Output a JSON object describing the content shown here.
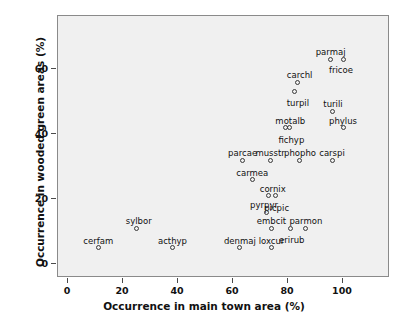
{
  "chart_data": {
    "type": "scatter",
    "title": "",
    "xlabel": "Occurrence in main town area (%)",
    "ylabel": "Occurrence in wooded green areas (%)",
    "xlim": [
      -4,
      118
    ],
    "ylim": [
      -4,
      76
    ],
    "xticks": [
      0,
      20,
      40,
      60,
      80,
      100
    ],
    "yticks": [
      0,
      20,
      40,
      60
    ],
    "xticklabels": [
      "0",
      "20",
      "40",
      "60",
      "80",
      "100"
    ],
    "yticklabels": [
      "0",
      "20",
      "40",
      "60"
    ],
    "grid": false,
    "legend": false,
    "marker": "open-circle",
    "plot_background": "#f0f0f0",
    "marker_color": "#3a3a3a",
    "points": [
      {
        "label": "parmaj",
        "x": 95.5,
        "y": 63.0,
        "label_dx": 0,
        "label_dy": -11
      },
      {
        "label": "fricoe",
        "x": 100.0,
        "y": 63.0,
        "label_dx": -2,
        "label_dy": 7
      },
      {
        "label": "carchl",
        "x": 83.5,
        "y": 56.0,
        "label_dx": 2,
        "label_dy": -11
      },
      {
        "label": "turpil",
        "x": 82.5,
        "y": 53.0,
        "label_dx": 3,
        "label_dy": 7
      },
      {
        "label": "turili",
        "x": 96.0,
        "y": 47.0,
        "label_dx": 1,
        "label_dy": -11
      },
      {
        "label": "phylus",
        "x": 100.0,
        "y": 42.0,
        "label_dx": 0,
        "label_dy": -11
      },
      {
        "label": "motalb",
        "x": 79.0,
        "y": 42.0,
        "label_dx": 5,
        "label_dy": -11
      },
      {
        "label": "fichyp",
        "x": 80.5,
        "y": 42.0,
        "label_dx": 2,
        "label_dy": 8
      },
      {
        "label": "parcae",
        "x": 63.5,
        "y": 32.0,
        "label_dx": 0,
        "label_dy": -11
      },
      {
        "label": "musstr",
        "x": 73.5,
        "y": 32.0,
        "label_dx": 0,
        "label_dy": -11
      },
      {
        "label": "phopho",
        "x": 84.0,
        "y": 32.0,
        "label_dx": 1,
        "label_dy": -11
      },
      {
        "label": "carspi",
        "x": 96.0,
        "y": 32.0,
        "label_dx": 0,
        "label_dy": -11
      },
      {
        "label": "carmea",
        "x": 67.0,
        "y": 26.0,
        "label_dx": 0,
        "label_dy": -11
      },
      {
        "label": "cornix",
        "x": 73.0,
        "y": 21.0,
        "label_dx": 4,
        "label_dy": -11
      },
      {
        "label": "picpic",
        "x": 75.5,
        "y": 21.0,
        "label_dx": 1,
        "label_dy": 8
      },
      {
        "label": "pyrpyr",
        "x": 72.0,
        "y": 16.0,
        "label_dx": -2,
        "label_dy": -11
      },
      {
        "label": "embcit",
        "x": 74.0,
        "y": 11.0,
        "label_dx": 0,
        "label_dy": -11
      },
      {
        "label": "erirub",
        "x": 81.0,
        "y": 11.0,
        "label_dx": 1,
        "label_dy": 8
      },
      {
        "label": "parmon",
        "x": 86.5,
        "y": 11.0,
        "label_dx": 0,
        "label_dy": -11
      },
      {
        "label": "sylbor",
        "x": 25.0,
        "y": 11.0,
        "label_dx": 2,
        "label_dy": -11
      },
      {
        "label": "cerfam",
        "x": 11.0,
        "y": 5.0,
        "label_dx": 0,
        "label_dy": -11
      },
      {
        "label": "acthyp",
        "x": 38.0,
        "y": 5.0,
        "label_dx": 0,
        "label_dy": -11
      },
      {
        "label": "denmaj",
        "x": 62.5,
        "y": 5.0,
        "label_dx": 0,
        "label_dy": -11
      },
      {
        "label": "loxcur",
        "x": 74.0,
        "y": 5.0,
        "label_dx": 0,
        "label_dy": -11
      }
    ]
  }
}
